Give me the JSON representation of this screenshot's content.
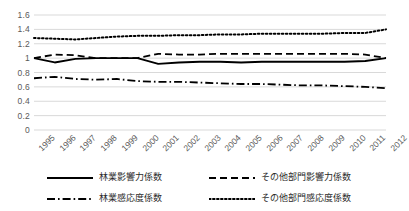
{
  "chart_data": {
    "type": "line",
    "title": "",
    "xlabel": "",
    "ylabel": "",
    "grid": true,
    "legend_position": "bottom",
    "ylim": [
      0,
      1.6
    ],
    "ytick_step": 0.2,
    "yticks": [
      "0",
      "0.2",
      "0.4",
      "0.6",
      "0.8",
      "1",
      "1.2",
      "1.4",
      "1.6"
    ],
    "categories": [
      "1995",
      "1996",
      "1997",
      "1998",
      "1999",
      "2000",
      "2001",
      "2002",
      "2003",
      "2004",
      "2005",
      "2006",
      "2007",
      "2008",
      "2009",
      "2010",
      "2011",
      "2012"
    ],
    "series": [
      {
        "name": "林業影響力係数",
        "style": "solid",
        "color": "#000000",
        "values": [
          1.0,
          0.94,
          0.99,
          1.0,
          1.0,
          1.0,
          0.92,
          0.94,
          0.95,
          0.95,
          0.94,
          0.95,
          0.95,
          0.95,
          0.95,
          0.95,
          0.96,
          1.0
        ]
      },
      {
        "name": "その他部門影響力係数",
        "style": "dashed",
        "color": "#000000",
        "values": [
          1.0,
          1.05,
          1.04,
          1.0,
          1.0,
          1.0,
          1.06,
          1.05,
          1.05,
          1.06,
          1.06,
          1.06,
          1.06,
          1.06,
          1.06,
          1.06,
          1.05,
          1.0
        ]
      },
      {
        "name": "林業感応度係数",
        "style": "dashdot",
        "color": "#000000",
        "values": [
          0.72,
          0.74,
          0.71,
          0.7,
          0.71,
          0.68,
          0.67,
          0.67,
          0.66,
          0.65,
          0.64,
          0.64,
          0.63,
          0.62,
          0.62,
          0.61,
          0.6,
          0.58
        ]
      },
      {
        "name": "その他部門感応度係数",
        "style": "dotted",
        "color": "#000000",
        "values": [
          1.28,
          1.27,
          1.26,
          1.28,
          1.3,
          1.31,
          1.31,
          1.32,
          1.32,
          1.33,
          1.33,
          1.34,
          1.34,
          1.34,
          1.34,
          1.35,
          1.35,
          1.4
        ]
      }
    ]
  },
  "style": {
    "gridline_color": "#d9d9d9",
    "axis_text_color": "#595959",
    "legend_text_color": "#2b2b2b",
    "plot_background": "#ffffff"
  }
}
